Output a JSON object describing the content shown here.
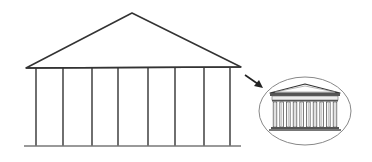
{
  "diagram": {
    "title": "",
    "colors": {
      "background": "#ffffff",
      "stroke": "#333333",
      "base_line": "#777777",
      "oval_stroke": "#888888",
      "temple_fill": "#ffffff",
      "temple_shade": "#bbbbbb"
    },
    "large_building": {
      "label": "simplified building outline",
      "roof_peak": [
        132,
        13
      ],
      "roof_left": [
        26,
        68
      ],
      "roof_right": [
        241,
        67
      ],
      "column_xs": [
        36,
        63,
        92,
        118,
        148,
        175,
        204,
        230
      ],
      "column_top_y": 68,
      "column_bottom_y": 146,
      "base_y": 146,
      "base_x": [
        24,
        241
      ]
    },
    "arrow": {
      "label": "points to detailed view",
      "from": [
        245,
        75
      ],
      "to": [
        262,
        86
      ]
    },
    "inset": {
      "label": "Greek temple (detailed)",
      "oval_center": [
        305,
        111
      ],
      "oval_rx": 46,
      "oval_ry": 34,
      "column_count": 10
    }
  }
}
